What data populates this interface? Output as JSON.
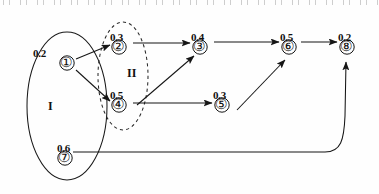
{
  "diagram": {
    "regions": [
      {
        "id": "I",
        "label": "I",
        "style": "solid",
        "label_x": 48,
        "label_y": 100
      },
      {
        "id": "II",
        "label": "II",
        "style": "dashed",
        "label_x": 127,
        "label_y": 67
      }
    ],
    "nodes": [
      {
        "id": "1",
        "glyph": "①",
        "weight": "0.2",
        "x": 67,
        "y": 63,
        "weight_x": 33,
        "weight_y": 48,
        "region": "I"
      },
      {
        "id": "2",
        "glyph": "②",
        "weight": "0.3",
        "x": 119,
        "y": 47,
        "weight_x": 110,
        "weight_y": 32,
        "region": "II"
      },
      {
        "id": "3",
        "glyph": "③",
        "weight": "0.4",
        "x": 200,
        "y": 47,
        "weight_x": 191,
        "weight_y": 32,
        "region": ""
      },
      {
        "id": "4",
        "glyph": "④",
        "weight": "0.5",
        "x": 119,
        "y": 105,
        "weight_x": 110,
        "weight_y": 90,
        "region": "II"
      },
      {
        "id": "5",
        "glyph": "⑤",
        "weight": "0.3",
        "x": 222,
        "y": 105,
        "weight_x": 213,
        "weight_y": 90,
        "region": ""
      },
      {
        "id": "6",
        "glyph": "⑥",
        "weight": "0.5",
        "x": 289,
        "y": 47,
        "weight_x": 280,
        "weight_y": 32,
        "region": ""
      },
      {
        "id": "7",
        "glyph": "⑦",
        "weight": "0.6",
        "x": 65,
        "y": 158,
        "weight_x": 57,
        "weight_y": 143,
        "region": "I"
      },
      {
        "id": "8",
        "glyph": "⑧",
        "weight": "0.2",
        "x": 347,
        "y": 47,
        "weight_x": 338,
        "weight_y": 32,
        "region": ""
      }
    ],
    "edges": [
      {
        "from": "1",
        "to": "2",
        "kind": "straight"
      },
      {
        "from": "1",
        "to": "4",
        "kind": "straight"
      },
      {
        "from": "2",
        "to": "3",
        "kind": "straight"
      },
      {
        "from": "4",
        "to": "3",
        "kind": "straight"
      },
      {
        "from": "4",
        "to": "5",
        "kind": "straight"
      },
      {
        "from": "3",
        "to": "6",
        "kind": "straight"
      },
      {
        "from": "5",
        "to": "6",
        "kind": "straight"
      },
      {
        "from": "6",
        "to": "8",
        "kind": "straight"
      },
      {
        "from": "7",
        "to": "8",
        "kind": "curved"
      }
    ],
    "colors": {
      "ink": "#111111",
      "line": "#1a1a1a",
      "background": "#ffffff"
    }
  }
}
